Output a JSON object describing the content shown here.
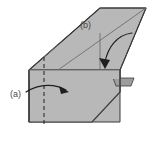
{
  "figure": {
    "background_color": "#ffffff",
    "fill_color": "#b8b8b8",
    "fill_color_dark": "#9d9d9d",
    "stroke_color": "#3a3a3a",
    "interior_line_color": "#707070",
    "label_color": "#4a4a4a",
    "labels": [
      {
        "id": "a",
        "text": "(a)",
        "x": 10,
        "y": 97
      },
      {
        "id": "b",
        "text": "(b)",
        "x": 80,
        "y": 28
      }
    ],
    "arrows": [
      {
        "id": "arrow-a",
        "from_label": "(a)",
        "path": "M 26,92 C 40,84 56,85 67,91",
        "head": "M 67,91 L 60,87 L 62,93 Z",
        "direction": "left-to-right"
      },
      {
        "id": "arrow-b",
        "from_label": "(b)",
        "path": "M 131,33 C 118,35 108,48 105,65",
        "head": "M 105,67 L 101,59 L 109,60 Z",
        "direction": "upper-right-to-lower-left"
      }
    ],
    "shapes": {
      "top_face": "M 29,70 L 100,8 L 146,8 L 120,70 Z",
      "front_face": "M 29,70 L 120,70 L 120,122 L 29,122 Z",
      "side_tab": "M 113,78 L 134,78 L 131,86 L 116,86 Z"
    },
    "fold_lines": [
      {
        "id": "vertical-dashed",
        "x1": 44,
        "y1": 57,
        "x2": 44,
        "y2": 124,
        "style": "dashed"
      },
      {
        "id": "horizontal-mid",
        "x1": 29,
        "y1": 70,
        "x2": 120,
        "y2": 70,
        "style": "solid"
      },
      {
        "id": "diagonal-fold",
        "x1": 146,
        "y1": 8,
        "x2": 60,
        "y2": 70,
        "style": "solid"
      },
      {
        "id": "vertical-mid-upper",
        "x1": 100,
        "y1": 34,
        "x2": 100,
        "y2": 70,
        "style": "solid"
      }
    ]
  }
}
